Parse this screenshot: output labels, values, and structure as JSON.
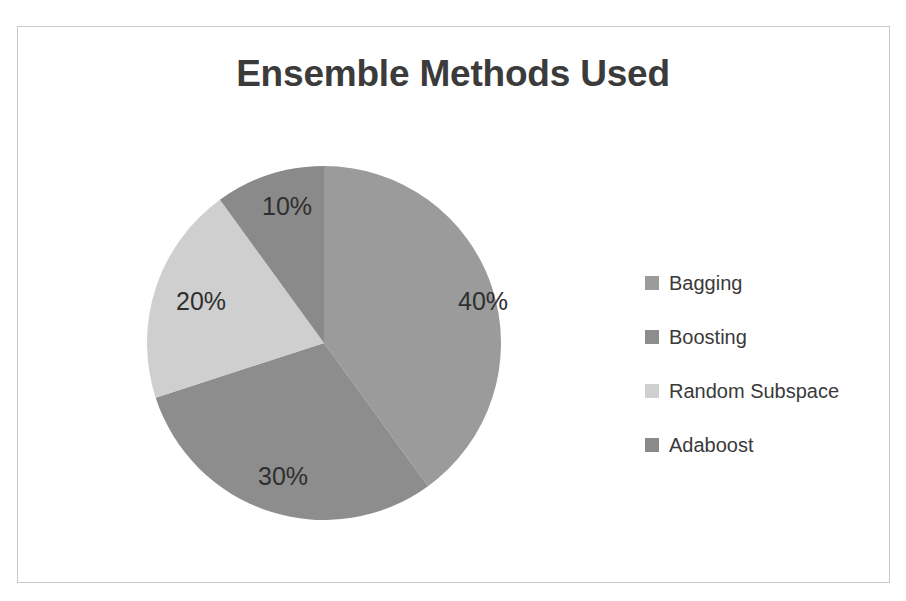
{
  "figure": {
    "title": "Ensemble Methods Used",
    "border_color": "#c9c9c9",
    "background": "#ffffff",
    "title_color": "#3b3b3b"
  },
  "chart_data": {
    "type": "pie",
    "title": "Ensemble Methods Used",
    "labels": [
      "Bagging",
      "Boosting",
      "Random Subspace",
      "Adaboost"
    ],
    "values": [
      40,
      30,
      20,
      10
    ],
    "value_labels": [
      "40%",
      "30%",
      "20%",
      "10%"
    ],
    "units": "percent",
    "total": 100,
    "start_angle_deg": 0,
    "direction": "clockwise",
    "colors": [
      "#9b9b9b",
      "#8d8d8d",
      "#cfcfcf",
      "#8a8a8a"
    ],
    "legend_position": "right",
    "grid": false,
    "xlabel": "",
    "ylabel": "",
    "slices": [
      {
        "label": "Bagging",
        "value": 40,
        "value_label": "40%",
        "color": "#9b9b9b"
      },
      {
        "label": "Boosting",
        "value": 30,
        "value_label": "30%",
        "color": "#8d8d8d"
      },
      {
        "label": "Random Subspace",
        "value": 20,
        "value_label": "20%",
        "color": "#cfcfcf"
      },
      {
        "label": "Adaboost",
        "value": 10,
        "value_label": "10%",
        "color": "#8a8a8a"
      }
    ]
  },
  "legend": {
    "items": [
      {
        "label": "Bagging",
        "color": "#9b9b9b"
      },
      {
        "label": "Boosting",
        "color": "#8d8d8d"
      },
      {
        "label": "Random Subspace",
        "color": "#cfcfcf"
      },
      {
        "label": "Adaboost",
        "color": "#8a8a8a"
      }
    ]
  }
}
